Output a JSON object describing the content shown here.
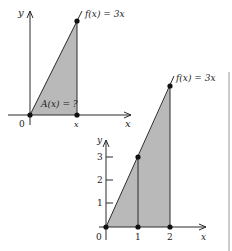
{
  "colors": {
    "fill": "#b9b9b9",
    "stroke": "#2a2a2a",
    "background": "#ffffff",
    "rule": "#9a9a9a"
  },
  "top_graph": {
    "y_axis_label": "y",
    "x_axis_label": "x",
    "origin_label": "0",
    "x_point_label": "x",
    "function_label": "f(x) = 3x",
    "area_label": "A(x) = ?"
  },
  "bottom_graph": {
    "y_axis_label": "y",
    "x_axis_label": "x",
    "origin_label": "0",
    "function_label": "f(x) = 3x",
    "x_ticks": [
      "1",
      "2"
    ],
    "y_ticks": [
      "1",
      "2",
      "3"
    ]
  }
}
